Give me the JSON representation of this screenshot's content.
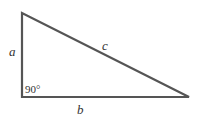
{
  "diagram": {
    "type": "right-triangle",
    "stroke_color": "#555555",
    "vertices": {
      "top": [
        22,
        13
      ],
      "right_angle": [
        22,
        97
      ],
      "right": [
        189,
        97
      ]
    },
    "labels": {
      "side_a": "a",
      "side_b": "b",
      "side_c": "c",
      "angle": "90°"
    }
  }
}
